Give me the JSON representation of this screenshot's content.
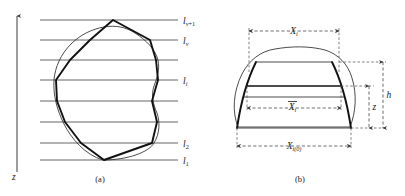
{
  "figure": {
    "title": "",
    "panels": [
      {
        "id": "a",
        "caption": "(a)",
        "axis_label": "z",
        "level_labels": [
          {
            "key": "l1",
            "base": "l",
            "sub": "1",
            "y": 160
          },
          {
            "key": "l2",
            "base": "l",
            "sub": "2",
            "y": 143
          },
          {
            "key": "li",
            "base": "l",
            "sub": "i",
            "y": 80
          },
          {
            "key": "lnu",
            "base": "l",
            "sub": "ν",
            "y": 40
          },
          {
            "key": "lnu1",
            "base": "l",
            "sub": "ν+1",
            "y": 20
          }
        ]
      },
      {
        "id": "b",
        "caption": "(b)",
        "dim_labels": [
          {
            "key": "Xi",
            "base": "X",
            "sub": "i",
            "overbar": false
          },
          {
            "key": "Xibar",
            "base": "X",
            "sub": "i",
            "overbar": true
          },
          {
            "key": "Xi0",
            "base": "X",
            "sub": "i(0)",
            "overbar": false
          },
          {
            "key": "h",
            "base": "h",
            "sub": "",
            "overbar": false
          },
          {
            "key": "z",
            "base": "z",
            "sub": "",
            "overbar": false
          }
        ]
      }
    ],
    "colors": {
      "ink": "#1a1a1a",
      "line": "#3d3d3d",
      "bold": "#111111",
      "background": "#ffffff"
    }
  }
}
